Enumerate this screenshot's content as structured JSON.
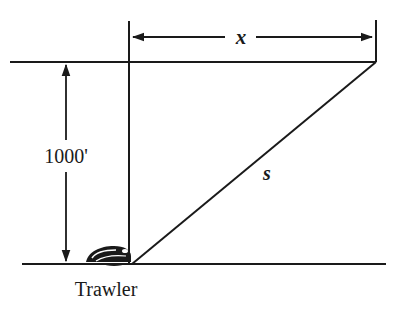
{
  "diagram": {
    "type": "geometry-word-problem",
    "labels": {
      "horizontal_distance": "x",
      "slant_distance": "s",
      "height": "1000'",
      "object": "Trawler"
    },
    "colors": {
      "stroke": "#1a1a1a",
      "background": "#ffffff"
    }
  }
}
